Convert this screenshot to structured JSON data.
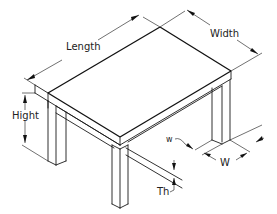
{
  "diagram": {
    "labels": {
      "length": "Length",
      "width": "Width",
      "height": "Hight",
      "leg_width_small": "w",
      "leg_width_large": "W",
      "thickness": "Th"
    },
    "colors": {
      "line": "#1a1a1a",
      "background": "#ffffff"
    }
  }
}
